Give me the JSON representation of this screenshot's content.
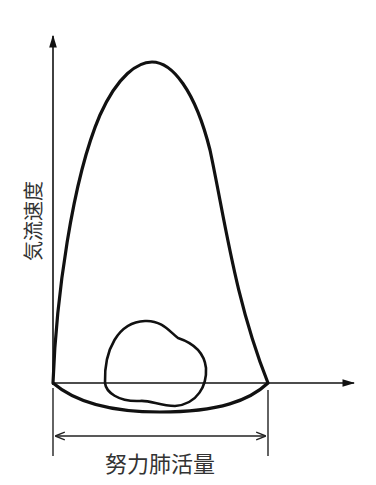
{
  "diagram": {
    "y_axis_label": "気流速度",
    "x_dimension_label": "努力肺活量",
    "elements": [
      "y-axis",
      "x-axis",
      "max-effort-flow-volume-loop",
      "tidal-flow-volume-loop",
      "fvc-dimension-line"
    ]
  }
}
